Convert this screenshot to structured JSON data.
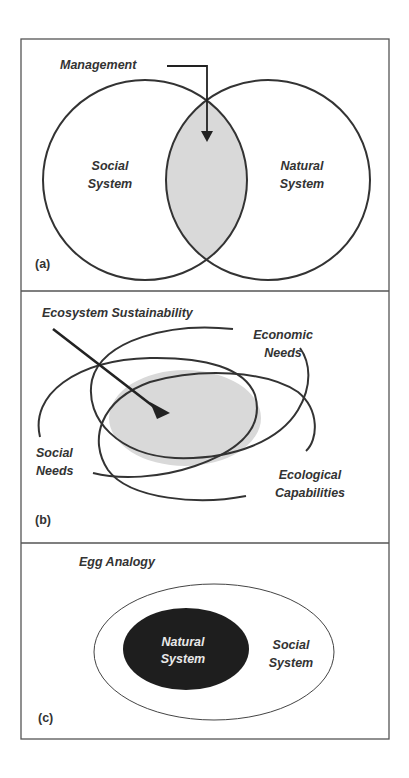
{
  "figure": {
    "panels": [
      {
        "id": "a",
        "tag": "(a)",
        "title": "Management",
        "circles": [
          {
            "label_line1": "Social",
            "label_line2": "System"
          },
          {
            "label_line1": "Natural",
            "label_line2": "System"
          }
        ],
        "overlap_label": "Management"
      },
      {
        "id": "b",
        "tag": "(b)",
        "title": "Ecosystem Sustainability",
        "sets": [
          {
            "label_line1": "Economic",
            "label_line2": "Needs"
          },
          {
            "label_line1": "Social",
            "label_line2": "Needs"
          },
          {
            "label_line1": "Ecological",
            "label_line2": "Capabilities"
          }
        ],
        "overlap_label": "Ecosystem Sustainability"
      },
      {
        "id": "c",
        "tag": "(c)",
        "title": "Egg Analogy",
        "inner": {
          "label_line1": "Natural",
          "label_line2": "System"
        },
        "outer": {
          "label_line1": "Social",
          "label_line2": "System"
        }
      }
    ]
  },
  "colors": {
    "stroke": "#333333",
    "overlap_fill": "#d9d9d9",
    "yolk_fill": "#1e1e1e",
    "frame": "#555555"
  }
}
